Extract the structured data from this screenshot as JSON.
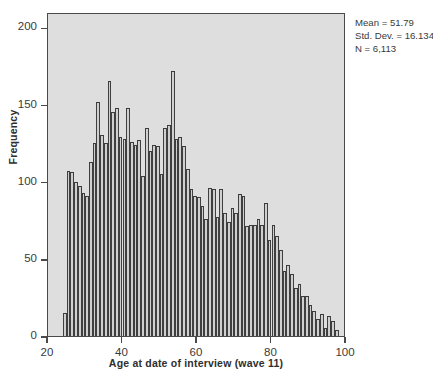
{
  "chart_data": {
    "type": "bar",
    "title": "",
    "subtitle": "",
    "xlabel": "Age at date of interview (wave 11)",
    "ylabel": "Frequency",
    "xlim": [
      20,
      100
    ],
    "ylim": [
      0,
      210
    ],
    "xticks": [
      20,
      40,
      60,
      80,
      100
    ],
    "yticks": [
      0,
      50,
      100,
      150,
      200
    ],
    "grid": false,
    "legend": null,
    "bin_width": 1,
    "categories": [
      24,
      25,
      26,
      27,
      28,
      29,
      30,
      31,
      32,
      33,
      34,
      35,
      36,
      37,
      38,
      39,
      40,
      41,
      42,
      43,
      44,
      45,
      46,
      47,
      48,
      49,
      50,
      51,
      52,
      53,
      54,
      55,
      56,
      57,
      58,
      59,
      60,
      61,
      62,
      63,
      64,
      65,
      66,
      67,
      68,
      69,
      70,
      71,
      72,
      73,
      74,
      75,
      76,
      77,
      78,
      79,
      80,
      81,
      82,
      83,
      84,
      85,
      86,
      87,
      88,
      89,
      90,
      91,
      92,
      93,
      94,
      95,
      96,
      97
    ],
    "values": [
      15,
      107,
      106,
      100,
      97,
      93,
      91,
      113,
      125,
      152,
      130,
      125,
      165,
      145,
      148,
      129,
      128,
      148,
      126,
      124,
      127,
      104,
      135,
      120,
      124,
      123,
      105,
      135,
      137,
      172,
      128,
      129,
      123,
      108,
      95,
      91,
      90,
      84,
      76,
      96,
      95,
      77,
      95,
      80,
      74,
      83,
      80,
      92,
      91,
      71,
      72,
      72,
      76,
      72,
      86,
      62,
      72,
      65,
      56,
      42,
      46,
      40,
      31,
      34,
      26,
      26,
      20,
      16,
      11,
      14,
      5,
      13,
      10,
      4
    ],
    "annotations": {
      "mean_label": "Mean = 51.79",
      "stddev_label": "Std. Dev. = 16.134",
      "n_label": "N = 6,113"
    },
    "colors": {
      "bar_fill": "#cfcfcf",
      "bar_edge": "#3a3a3a",
      "plot_background": "#dedede",
      "axis": "#4a4a4a",
      "text": "#3a3a3a",
      "figure_background": "#ffffff"
    }
  }
}
